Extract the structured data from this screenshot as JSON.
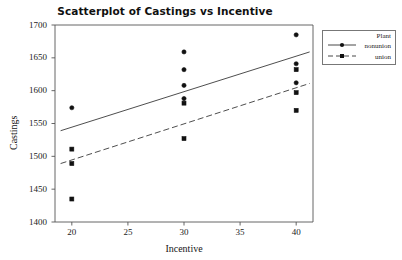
{
  "chart_data": {
    "type": "scatter",
    "title": "Scatterplot of Castings vs Incentive",
    "xlabel": "Incentive",
    "ylabel": "Castings",
    "xlim": [
      18.5,
      41.5
    ],
    "ylim": [
      1400,
      1700
    ],
    "xticks": [
      20,
      25,
      30,
      35,
      40
    ],
    "yticks": [
      1400,
      1450,
      1500,
      1550,
      1600,
      1650,
      1700
    ],
    "grid": false,
    "legend": {
      "title": "Plant",
      "position": "right-outside",
      "entries": [
        {
          "label": "nonunion",
          "marker": "filled-circle",
          "line": "solid"
        },
        {
          "label": "union",
          "marker": "filled-square",
          "line": "dashed"
        }
      ]
    },
    "series": [
      {
        "name": "nonunion",
        "marker": "filled-circle",
        "line": "solid",
        "points": [
          {
            "x": 20,
            "y": 1574
          },
          {
            "x": 30,
            "y": 1659
          },
          {
            "x": 30,
            "y": 1632
          },
          {
            "x": 30,
            "y": 1608
          },
          {
            "x": 30,
            "y": 1588
          },
          {
            "x": 40,
            "y": 1685
          },
          {
            "x": 40,
            "y": 1641
          },
          {
            "x": 40,
            "y": 1612
          }
        ],
        "fit_line": {
          "x1": 19.0,
          "y1": 1539,
          "x2": 41.2,
          "y2": 1659
        }
      },
      {
        "name": "union",
        "marker": "filled-square",
        "line": "dashed",
        "points": [
          {
            "x": 20,
            "y": 1511
          },
          {
            "x": 20,
            "y": 1489
          },
          {
            "x": 20,
            "y": 1435
          },
          {
            "x": 30,
            "y": 1581
          },
          {
            "x": 30,
            "y": 1527
          },
          {
            "x": 40,
            "y": 1632
          },
          {
            "x": 40,
            "y": 1597
          },
          {
            "x": 40,
            "y": 1570
          }
        ],
        "fit_line": {
          "x1": 19.0,
          "y1": 1489,
          "x2": 41.2,
          "y2": 1611
        }
      }
    ]
  }
}
